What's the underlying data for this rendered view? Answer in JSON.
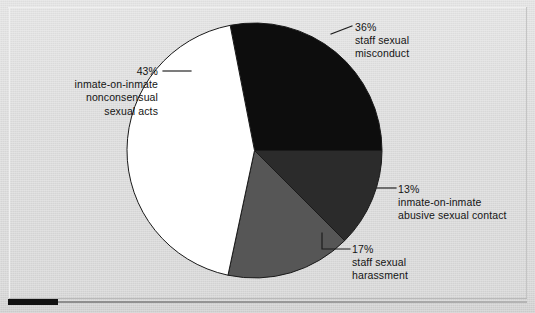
{
  "figure": {
    "background_color": "#dcdcdc",
    "outline_color": "#1a1a1a",
    "index_bar_color": "#111111"
  },
  "chart_data": {
    "type": "pie",
    "title": "",
    "subtitle": "",
    "xlabel": "",
    "ylabel": "",
    "legend_position": "callout-labels",
    "grid": false,
    "total": 109,
    "units": "percent",
    "categories": [
      "staff sexual misconduct",
      "inmate-on-inmate abusive sexual contact",
      "staff sexual harassment",
      "inmate-on-inmate nonconsensual sexual acts"
    ],
    "values": [
      36,
      13,
      17,
      43
    ],
    "slices": [
      {
        "id": "staff-sexual-misconduct",
        "percent_text": "36%",
        "value": 36,
        "label_lines": [
          "staff sexual",
          "misconduct"
        ],
        "color": "#0d0d0d",
        "start_angle_deg": 349,
        "end_angle_deg": 90
      },
      {
        "id": "inmate-on-inmate-abusive-sexual-contact",
        "percent_text": "13%",
        "value": 13,
        "label_lines": [
          "inmate-on-inmate",
          "abusive sexual contact"
        ],
        "color": "#2b2b2b",
        "start_angle_deg": 90,
        "end_angle_deg": 135
      },
      {
        "id": "staff-sexual-harassment",
        "percent_text": "17%",
        "value": 17,
        "label_lines": [
          "staff sexual",
          "harassment"
        ],
        "color": "#565656",
        "start_angle_deg": 135,
        "end_angle_deg": 192
      },
      {
        "id": "inmate-on-inmate-nonconsensual-sexual-acts",
        "percent_text": "43%",
        "value": 43,
        "label_lines": [
          "inmate-on-inmate",
          "nonconsensual",
          "sexual acts"
        ],
        "color": "#ffffff",
        "start_angle_deg": 192,
        "end_angle_deg": 349
      }
    ]
  }
}
